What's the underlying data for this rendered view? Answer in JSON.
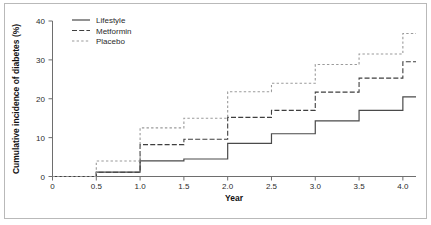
{
  "chart_data": {
    "type": "line",
    "subtype": "step",
    "title": "",
    "xlabel": "Year",
    "ylabel": "Cumulative incidence of diabetes (%)",
    "xlim": [
      0,
      4.15
    ],
    "ylim": [
      0,
      40
    ],
    "xticks": [
      0,
      0.5,
      1.0,
      1.5,
      2.0,
      2.5,
      3.0,
      3.5,
      4.0
    ],
    "xticklabels": [
      "0",
      "0.5",
      "1.0",
      "1.5",
      "2.0",
      "2.5",
      "3.0",
      "3.5",
      "4.0"
    ],
    "yticks": [
      0,
      10,
      20,
      30,
      40
    ],
    "yticklabels": [
      "0",
      "10",
      "20",
      "30",
      "40"
    ],
    "grid": false,
    "legend_position": "top-left",
    "x": [
      0,
      0.5,
      1.0,
      1.5,
      2.0,
      2.5,
      3.0,
      3.5,
      4.0,
      4.15
    ],
    "series": [
      {
        "name": "Lifestyle",
        "style": "solid",
        "color": "#4a4a4a",
        "values": [
          0,
          1.1,
          4.0,
          4.5,
          8.5,
          11.0,
          14.3,
          17.0,
          20.5,
          20.5
        ]
      },
      {
        "name": "Metformin",
        "style": "dashed",
        "color": "#3f3f3f",
        "values": [
          0,
          1.1,
          8.2,
          9.6,
          15.2,
          17.0,
          21.7,
          25.3,
          29.5,
          29.5
        ]
      },
      {
        "name": "Placebo",
        "style": "dotted",
        "color": "#9a9a9a",
        "values": [
          0,
          4.0,
          12.5,
          15.0,
          21.8,
          24.0,
          28.8,
          31.5,
          36.8,
          36.8
        ]
      }
    ]
  },
  "legend": {
    "entries": [
      {
        "label": "Lifestyle"
      },
      {
        "label": "Metformin"
      },
      {
        "label": "Placebo"
      }
    ]
  },
  "axes": {
    "x_title": "Year",
    "y_title": "Cumulative incidence of diabetes (%)"
  }
}
